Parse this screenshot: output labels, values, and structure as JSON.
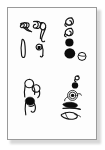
{
  "image": {
    "kind": "scanned-artwork-plate",
    "title": "",
    "caption": "",
    "background_color": "#ffffff",
    "paper_color": "#fdfdfd",
    "border_color": "#9a9a9a",
    "ink_color": "#0c0c0c",
    "shadow_color": "#b8b8b8",
    "width": 105,
    "height": 150
  },
  "plate": {
    "frame": {
      "name": "paper-frame",
      "x": 7,
      "y": 7,
      "width": 90,
      "height": 133,
      "border_width": 1
    },
    "groups": [
      {
        "id": "top-left",
        "name": "glyph-group-top-left",
        "position": "upper-left",
        "description": "Cluster of hand-drawn ink marks: a pair of slanted hooked loops above, a narrow vertical blade stroke at lower left, and a small loop with a solid dot at lower right.",
        "mark_count": 5,
        "marks": [
          {
            "name": "hook-loop-mark",
            "style": "outline",
            "note": "slanted double-hook at top left"
          },
          {
            "name": "comma-loop-mark",
            "style": "outline",
            "note": "tail curling right of the hook pair"
          },
          {
            "name": "tall-loop-mark",
            "style": "outline",
            "note": "upright loop with descending tail, top right"
          },
          {
            "name": "blade-stroke-mark",
            "style": "outline",
            "note": "slim vertical leaf/blade, lower left"
          },
          {
            "name": "loop-with-dot-mark",
            "style": "outline-and-fill",
            "note": "small closed loop containing a solid square dot"
          }
        ]
      },
      {
        "id": "top-right",
        "name": "glyph-group-top-right",
        "position": "upper-right",
        "description": "Vertical column of marks: two stacked spiral hooks, then a medium solid black disc, a larger solid black disc, and a small open circle with a short bar.",
        "mark_count": 5,
        "marks": [
          {
            "name": "spiral-hook-mark",
            "style": "outline",
            "note": "upper spiral hook"
          },
          {
            "name": "spiral-hook-mark",
            "style": "outline",
            "note": "second spiral hook below the first"
          },
          {
            "name": "solid-disc-mark",
            "style": "fill",
            "note": "medium filled circle"
          },
          {
            "name": "solid-disc-mark",
            "style": "fill",
            "note": "largest filled circle"
          },
          {
            "name": "open-circle-mark",
            "style": "outline",
            "note": "small hollow circle with crossing bar, lower right"
          }
        ]
      },
      {
        "id": "bottom-left",
        "name": "glyph-group-bottom-left",
        "position": "lower-left",
        "description": "Stacked pair of ring-and-stem marks: an open ring on a stem above, and a filled ring on a stem below.",
        "mark_count": 3,
        "marks": [
          {
            "name": "ring-on-stem-mark",
            "style": "outline",
            "note": "hollow ring with vertical stem, top"
          },
          {
            "name": "open-ring-mark",
            "style": "outline",
            "note": "second hollow ring, slightly right and below"
          },
          {
            "name": "filled-ring-on-stem-mark",
            "style": "outline-and-fill",
            "note": "solid blob ring with stem, bottom"
          }
        ]
      },
      {
        "id": "bottom-right",
        "name": "glyph-group-bottom-right",
        "position": "lower-right",
        "description": "Diagonal column of marks: a tiny hook at top, a solid dot, a concentric spiral eye, a solid teardrop, and an outlined teardrop with a trailing stroke at the bottom.",
        "mark_count": 6,
        "marks": [
          {
            "name": "tiny-hook-mark",
            "style": "outline",
            "note": "small hook at the very top"
          },
          {
            "name": "solid-dot-mark",
            "style": "fill",
            "note": "small filled dot"
          },
          {
            "name": "concentric-spiral-mark",
            "style": "outline",
            "note": "eye-like concentric spiral with a solid centre"
          },
          {
            "name": "solid-teardrop-mark",
            "style": "fill",
            "note": "filled teardrop pointing right"
          },
          {
            "name": "tail-stroke-mark",
            "style": "outline",
            "note": "long sweeping tail under the teardrop"
          },
          {
            "name": "outlined-teardrop-mark",
            "style": "outline",
            "note": "hollow teardrop with inner line, bottom"
          }
        ]
      }
    ]
  }
}
